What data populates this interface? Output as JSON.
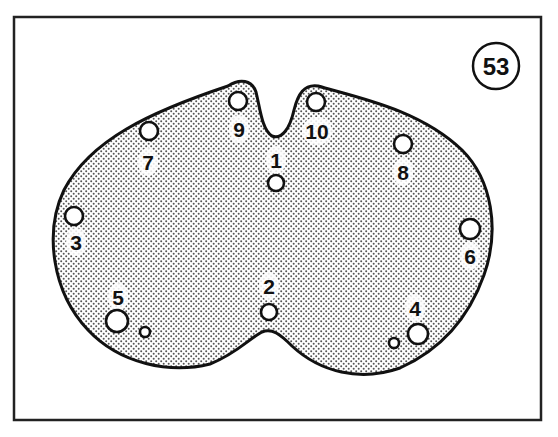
{
  "figure": {
    "badge": {
      "label": "53"
    },
    "colors": {
      "background": "#ffffff",
      "ink": "#111111",
      "stipple": "#555555"
    },
    "holes": [
      {
        "id": "1",
        "label": "1",
        "cx": 276,
        "cy": 183,
        "r": 8,
        "lx": 276,
        "ly": 168
      },
      {
        "id": "2",
        "label": "2",
        "cx": 269,
        "cy": 312,
        "r": 8,
        "lx": 269,
        "ly": 294
      },
      {
        "id": "3",
        "label": "3",
        "cx": 74,
        "cy": 216,
        "r": 9,
        "lx": 76,
        "ly": 250
      },
      {
        "id": "4",
        "label": "4",
        "cx": 418,
        "cy": 334,
        "r": 10,
        "lx": 415,
        "ly": 316
      },
      {
        "id": "5",
        "label": "5",
        "cx": 117,
        "cy": 321,
        "r": 11,
        "lx": 118,
        "ly": 305
      },
      {
        "id": "6",
        "label": "6",
        "cx": 470,
        "cy": 229,
        "r": 10,
        "lx": 470,
        "ly": 264
      },
      {
        "id": "7",
        "label": "7",
        "cx": 149,
        "cy": 131,
        "r": 9,
        "lx": 148,
        "ly": 170
      },
      {
        "id": "8",
        "label": "8",
        "cx": 403,
        "cy": 144,
        "r": 9,
        "lx": 403,
        "ly": 180
      },
      {
        "id": "9",
        "label": "9",
        "cx": 238,
        "cy": 101,
        "r": 9,
        "lx": 239,
        "ly": 137
      },
      {
        "id": "10",
        "label": "10",
        "cx": 316,
        "cy": 102,
        "r": 9,
        "lx": 317,
        "ly": 139
      }
    ],
    "small_holes": [
      {
        "near": "5",
        "cx": 145,
        "cy": 332,
        "r": 5
      },
      {
        "near": "4",
        "cx": 394,
        "cy": 343,
        "r": 5
      }
    ]
  }
}
